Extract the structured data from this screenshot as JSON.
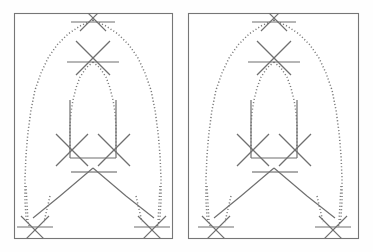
{
  "image": {
    "title": "Two identical abstract line drawings side by side",
    "width": 373,
    "height": 252,
    "background_color": "#fefefe",
    "stroke_color": "#6f6f6f",
    "dotted_stroke_color": "#7a7a7a",
    "frame_color": "#767676"
  },
  "panels": [
    {
      "id": "left-panel",
      "label": "Left panel",
      "frame": {
        "x": 14,
        "y": 13,
        "width": 158,
        "height": 225
      }
    },
    {
      "id": "right-panel",
      "label": "Right panel",
      "frame": {
        "x": 188,
        "y": 13,
        "width": 170,
        "height": 225
      }
    }
  ],
  "figure": {
    "apex": {
      "x": 93,
      "y": 18
    },
    "box": {
      "left": 70,
      "right": 116,
      "top": 100,
      "bottom": 158
    },
    "feet": [
      {
        "x": 35,
        "y": 230
      },
      {
        "x": 152,
        "y": 230
      }
    ],
    "cross_markers": [
      {
        "name": "apex-cross",
        "cx": 93,
        "cy": 18,
        "size": 13,
        "bar_half": 22,
        "bar_dy": 4
      },
      {
        "name": "mid-cross",
        "cx": 93,
        "cy": 58,
        "size": 17,
        "bar_half": 26,
        "bar_dy": 4
      },
      {
        "name": "box-left-cross",
        "cx": 72,
        "cy": 150,
        "size": 16,
        "bar": false
      },
      {
        "name": "box-right-cross",
        "cx": 114,
        "cy": 150,
        "size": 16,
        "bar": false
      },
      {
        "name": "foot-left-cross",
        "cx": 35,
        "cy": 230,
        "size": 14,
        "bar_half": 20,
        "bar_dy": -3
      },
      {
        "name": "foot-right-cross",
        "cx": 152,
        "cy": 230,
        "size": 14,
        "bar_half": 20,
        "bar_dy": -3
      }
    ],
    "horizontal_bars": [
      {
        "name": "apex-bar",
        "x1": 71,
        "x2": 115,
        "y": 22
      },
      {
        "name": "mid-bar",
        "x1": 67,
        "x2": 119,
        "y": 62
      },
      {
        "name": "box-bottom-bar",
        "x1": 70,
        "x2": 116,
        "y": 158
      },
      {
        "name": "tie-bar-left",
        "x1": 71,
        "x2": 93,
        "y": 172
      },
      {
        "name": "tie-bar-right",
        "x1": 93,
        "x2": 117,
        "y": 172
      },
      {
        "name": "foot-left-bar",
        "x1": 17,
        "x2": 53,
        "y": 227
      },
      {
        "name": "foot-right-bar",
        "x1": 134,
        "x2": 170,
        "y": 227
      }
    ]
  },
  "chart_data": {
    "type": "line",
    "xlabel": "",
    "ylabel": "",
    "grid": false,
    "legend": "none",
    "series": [
      {
        "name": "outer-arch-left",
        "style": "dotted",
        "points": [
          [
            93,
            20
          ],
          [
            80,
            26
          ],
          [
            68,
            34
          ],
          [
            57,
            45
          ],
          [
            48,
            58
          ],
          [
            41,
            73
          ],
          [
            35,
            90
          ],
          [
            31,
            110
          ],
          [
            28,
            132
          ],
          [
            26,
            155
          ],
          [
            25,
            178
          ],
          [
            25,
            200
          ],
          [
            26,
            218
          ],
          [
            30,
            228
          ]
        ]
      },
      {
        "name": "outer-arch-right",
        "style": "dotted",
        "points": [
          [
            93,
            20
          ],
          [
            106,
            26
          ],
          [
            118,
            34
          ],
          [
            129,
            45
          ],
          [
            138,
            58
          ],
          [
            145,
            73
          ],
          [
            151,
            90
          ],
          [
            155,
            110
          ],
          [
            158,
            132
          ],
          [
            160,
            155
          ],
          [
            161,
            178
          ],
          [
            161,
            200
          ],
          [
            160,
            218
          ],
          [
            157,
            228
          ]
        ]
      },
      {
        "name": "inner-arch-left",
        "style": "dotted",
        "points": [
          [
            93,
            62
          ],
          [
            86,
            68
          ],
          [
            80,
            77
          ],
          [
            76,
            88
          ],
          [
            73,
            100
          ],
          [
            71,
            112
          ],
          [
            70,
            126
          ],
          [
            70,
            140
          ],
          [
            70,
            152
          ]
        ]
      },
      {
        "name": "inner-arch-right",
        "style": "dotted",
        "points": [
          [
            93,
            62
          ],
          [
            100,
            68
          ],
          [
            106,
            77
          ],
          [
            110,
            88
          ],
          [
            113,
            100
          ],
          [
            115,
            112
          ],
          [
            116,
            126
          ],
          [
            116,
            140
          ],
          [
            116,
            152
          ]
        ]
      },
      {
        "name": "leg-left",
        "style": "solid",
        "points": [
          [
            93,
            168
          ],
          [
            60,
            196
          ],
          [
            33,
            218
          ]
        ]
      },
      {
        "name": "leg-right",
        "style": "solid",
        "points": [
          [
            93,
            168
          ],
          [
            126,
            196
          ],
          [
            154,
            218
          ]
        ]
      },
      {
        "name": "dropline-left-outer",
        "style": "dotted",
        "points": [
          [
            26,
            186
          ],
          [
            28,
            222
          ]
        ]
      },
      {
        "name": "dropline-right-outer",
        "style": "dotted",
        "points": [
          [
            160,
            186
          ],
          [
            158,
            222
          ]
        ]
      },
      {
        "name": "dropline-left-inner",
        "style": "dotted",
        "points": [
          [
            50,
            196
          ],
          [
            44,
            222
          ]
        ]
      },
      {
        "name": "dropline-right-inner",
        "style": "dotted",
        "points": [
          [
            136,
            196
          ],
          [
            142,
            222
          ]
        ]
      }
    ]
  }
}
